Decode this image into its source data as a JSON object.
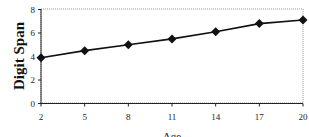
{
  "chart_data": {
    "type": "line",
    "title": "",
    "xlabel": "Age",
    "ylabel": "Digit Span",
    "x": [
      2,
      5,
      8,
      11,
      14,
      17,
      20
    ],
    "series": [
      {
        "name": "Digit Span",
        "values": [
          3.9,
          4.5,
          5.0,
          5.5,
          6.1,
          6.8,
          7.1
        ],
        "marker": "diamond",
        "color": "#111111"
      }
    ],
    "yticks": [
      0,
      2,
      4,
      6,
      8
    ],
    "xticks": [
      2,
      5,
      8,
      11,
      14,
      17,
      20
    ],
    "ylim": [
      0,
      8
    ],
    "xlim": [
      2,
      20
    ],
    "grid": false,
    "legend": null
  }
}
